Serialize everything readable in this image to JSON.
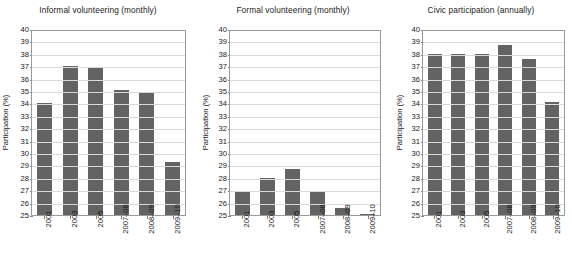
{
  "figure": {
    "ylabel": "Participation (%)",
    "bar_color": "#636363",
    "grid_color": "#d9d9d9",
    "frame_color": "#9a9a9a",
    "background": "#ffffff"
  },
  "chart_data": [
    {
      "type": "bar",
      "title": "Informal volunteering (monthly)",
      "xlabel": "",
      "ylabel": "Participation (%)",
      "categories": [
        "2001",
        "2003",
        "2005",
        "2007–08",
        "2008–09",
        "2009–10"
      ],
      "values": [
        34.0,
        37.0,
        36.9,
        35.1,
        34.85,
        29.3
      ],
      "ylim": [
        25,
        40
      ],
      "yticks": [
        25,
        26,
        27,
        28,
        29,
        30,
        31,
        32,
        33,
        34,
        35,
        36,
        37,
        38,
        39,
        40
      ],
      "grid": true,
      "legend": "none"
    },
    {
      "type": "bar",
      "title": "Formal volunteering (monthly)",
      "xlabel": "",
      "ylabel": "Participation (%)",
      "categories": [
        "2001",
        "2003",
        "2005",
        "2007–08",
        "2008–09",
        "2009–10"
      ],
      "values": [
        26.95,
        28.0,
        28.7,
        26.9,
        25.6,
        25.05
      ],
      "ylim": [
        25,
        40
      ],
      "yticks": [
        25,
        26,
        27,
        28,
        29,
        30,
        31,
        32,
        33,
        34,
        35,
        36,
        37,
        38,
        39,
        40
      ],
      "grid": true,
      "legend": "none"
    },
    {
      "type": "bar",
      "title": "Civic participation (annually)",
      "xlabel": "",
      "ylabel": "Participation (%)",
      "categories": [
        "2001",
        "2003",
        "2005",
        "2007–08",
        "2008–09",
        "2009–10"
      ],
      "values": [
        38.0,
        38.0,
        38.0,
        38.7,
        37.6,
        34.15
      ],
      "ylim": [
        25,
        40
      ],
      "yticks": [
        25,
        26,
        27,
        28,
        29,
        30,
        31,
        32,
        33,
        34,
        35,
        36,
        37,
        38,
        39,
        40
      ],
      "grid": true,
      "legend": "none"
    }
  ]
}
